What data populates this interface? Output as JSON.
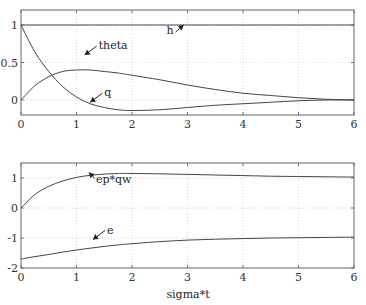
{
  "chart_data": [
    {
      "type": "line",
      "title": "",
      "xlabel": "",
      "ylabel": "",
      "xlim": [
        0,
        6
      ],
      "ylim": [
        -0.2,
        1.2
      ],
      "grid": true,
      "xticks": [
        "0",
        "1",
        "2",
        "3",
        "4",
        "5",
        "6"
      ],
      "yticks": [
        "0",
        "0.5",
        "1"
      ],
      "x": [
        0,
        0.25,
        0.5,
        0.75,
        1,
        1.25,
        1.5,
        1.75,
        2,
        2.5,
        3,
        3.5,
        4,
        4.5,
        5,
        5.5,
        6
      ],
      "series": [
        {
          "name": "h",
          "values": [
            1,
            1,
            1,
            1,
            1,
            1,
            1,
            1,
            1,
            1,
            1,
            1,
            1,
            1,
            1,
            1,
            1
          ]
        },
        {
          "name": "theta",
          "values": [
            0,
            0.19,
            0.31,
            0.38,
            0.4,
            0.4,
            0.38,
            0.36,
            0.33,
            0.27,
            0.2,
            0.14,
            0.09,
            0.06,
            0.03,
            0.01,
            0.0
          ]
        },
        {
          "name": "q",
          "values": [
            1,
            0.64,
            0.38,
            0.18,
            0.04,
            -0.05,
            -0.1,
            -0.13,
            -0.14,
            -0.13,
            -0.1,
            -0.07,
            -0.05,
            -0.03,
            -0.01,
            0.0,
            0.0
          ]
        }
      ],
      "annotations": [
        {
          "text": "h",
          "x": 2.75,
          "y": 0.88
        },
        {
          "text": "theta",
          "x": 1.4,
          "y": 0.68
        },
        {
          "text": "q",
          "x": 1.5,
          "y": 0.05
        }
      ]
    },
    {
      "type": "line",
      "title": "",
      "xlabel": "sigma*t",
      "ylabel": "",
      "xlim": [
        0,
        6
      ],
      "ylim": [
        -2,
        1.5
      ],
      "grid": true,
      "xticks": [
        "0",
        "1",
        "2",
        "3",
        "4",
        "5",
        "6"
      ],
      "yticks": [
        "-2",
        "-1",
        "0",
        "1"
      ],
      "x": [
        0,
        0.25,
        0.5,
        0.75,
        1,
        1.25,
        1.5,
        1.75,
        2,
        2.5,
        3,
        3.5,
        4,
        4.5,
        5,
        5.5,
        6
      ],
      "series": [
        {
          "name": "ep*qw",
          "values": [
            0,
            0.45,
            0.72,
            0.9,
            1.02,
            1.09,
            1.13,
            1.15,
            1.15,
            1.14,
            1.12,
            1.1,
            1.08,
            1.06,
            1.05,
            1.04,
            1.03
          ]
        },
        {
          "name": "e",
          "values": [
            -1.7,
            -1.62,
            -1.55,
            -1.47,
            -1.4,
            -1.34,
            -1.28,
            -1.23,
            -1.19,
            -1.12,
            -1.07,
            -1.04,
            -1.02,
            -1.0,
            -0.99,
            -0.98,
            -0.97
          ]
        }
      ],
      "annotations": [
        {
          "text": "ep*qw",
          "x": 1.35,
          "y": 0.85
        },
        {
          "text": "e",
          "x": 1.55,
          "y": -0.85
        }
      ]
    }
  ]
}
